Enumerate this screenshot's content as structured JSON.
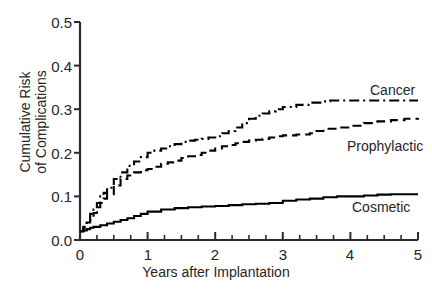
{
  "chart_data": {
    "type": "line",
    "title": "",
    "xlabel": "Years after Implantation",
    "ylabel": "Cumulative Risk of Complications",
    "xlim": [
      0,
      5
    ],
    "ylim": [
      0,
      0.5
    ],
    "grid": false,
    "legend_position": "inline-right-of-curves",
    "xticks": [
      0,
      1,
      2,
      3,
      4,
      5
    ],
    "xtick_labels": [
      "0",
      "1",
      "2",
      "3",
      "4",
      "5"
    ],
    "x_minor_tick_interval": 0.25,
    "yticks": [
      0.0,
      0.1,
      0.2,
      0.3,
      0.4,
      0.5
    ],
    "ytick_labels": [
      "0.0",
      "0.1",
      "0.2",
      "0.3",
      "0.4",
      "0.5"
    ],
    "series": [
      {
        "name": "Cancer",
        "line_style": "dash-dot",
        "color": "#000000",
        "x": [
          0,
          0.05,
          0.1,
          0.15,
          0.2,
          0.25,
          0.3,
          0.35,
          0.4,
          0.5,
          0.6,
          0.7,
          0.8,
          0.9,
          1.0,
          1.1,
          1.2,
          1.3,
          1.4,
          1.5,
          1.6,
          1.7,
          1.8,
          1.9,
          2.0,
          2.1,
          2.2,
          2.3,
          2.4,
          2.5,
          2.6,
          2.7,
          2.8,
          2.9,
          3.0,
          3.2,
          3.4,
          3.6,
          3.7,
          3.8,
          4.0,
          4.5,
          5.0
        ],
        "y": [
          0.02,
          0.03,
          0.045,
          0.06,
          0.07,
          0.085,
          0.1,
          0.108,
          0.12,
          0.14,
          0.155,
          0.17,
          0.18,
          0.19,
          0.2,
          0.205,
          0.21,
          0.215,
          0.22,
          0.225,
          0.228,
          0.23,
          0.232,
          0.235,
          0.238,
          0.245,
          0.25,
          0.258,
          0.268,
          0.278,
          0.285,
          0.29,
          0.295,
          0.3,
          0.305,
          0.31,
          0.315,
          0.318,
          0.32,
          0.32,
          0.32,
          0.32,
          0.32
        ]
      },
      {
        "name": "Prophylactic",
        "line_style": "dashed",
        "color": "#000000",
        "x": [
          0,
          0.05,
          0.1,
          0.15,
          0.2,
          0.25,
          0.3,
          0.35,
          0.4,
          0.5,
          0.6,
          0.7,
          0.8,
          0.9,
          1.0,
          1.1,
          1.2,
          1.3,
          1.4,
          1.5,
          1.6,
          1.7,
          1.8,
          1.9,
          2.0,
          2.1,
          2.2,
          2.3,
          2.4,
          2.5,
          2.6,
          2.7,
          2.8,
          2.9,
          3.0,
          3.2,
          3.4,
          3.5,
          3.6,
          3.8,
          4.0,
          4.2,
          4.4,
          4.6,
          4.8,
          5.0
        ],
        "y": [
          0.02,
          0.028,
          0.04,
          0.05,
          0.062,
          0.075,
          0.085,
          0.095,
          0.105,
          0.125,
          0.14,
          0.148,
          0.155,
          0.16,
          0.163,
          0.168,
          0.175,
          0.178,
          0.182,
          0.188,
          0.192,
          0.195,
          0.2,
          0.205,
          0.21,
          0.215,
          0.218,
          0.222,
          0.225,
          0.228,
          0.23,
          0.232,
          0.235,
          0.238,
          0.24,
          0.242,
          0.245,
          0.25,
          0.255,
          0.258,
          0.262,
          0.268,
          0.272,
          0.275,
          0.278,
          0.28
        ]
      },
      {
        "name": "Cosmetic",
        "line_style": "solid",
        "color": "#000000",
        "x": [
          0,
          0.05,
          0.1,
          0.15,
          0.2,
          0.3,
          0.4,
          0.5,
          0.6,
          0.7,
          0.8,
          0.9,
          1.0,
          1.2,
          1.4,
          1.6,
          1.8,
          2.0,
          2.2,
          2.4,
          2.6,
          2.8,
          3.0,
          3.2,
          3.4,
          3.6,
          3.8,
          4.0,
          4.2,
          4.4,
          4.6,
          4.8,
          5.0
        ],
        "y": [
          0.02,
          0.022,
          0.025,
          0.028,
          0.03,
          0.034,
          0.038,
          0.042,
          0.046,
          0.05,
          0.055,
          0.06,
          0.065,
          0.07,
          0.073,
          0.075,
          0.077,
          0.078,
          0.08,
          0.082,
          0.083,
          0.085,
          0.09,
          0.093,
          0.095,
          0.098,
          0.1,
          0.1,
          0.102,
          0.104,
          0.105,
          0.105,
          0.105
        ]
      }
    ],
    "series_labels": [
      {
        "text": "Cancer",
        "x_px": 370,
        "y_px": 82
      },
      {
        "text": "Prophylactic",
        "x_px": 347,
        "y_px": 138
      },
      {
        "text": "Cosmetic",
        "x_px": 352,
        "y_px": 199
      }
    ]
  },
  "axis": {
    "y_title_line1": "Cumulative Risk",
    "y_title_line2": "of Complications",
    "x_title": "Years after Implantation"
  }
}
